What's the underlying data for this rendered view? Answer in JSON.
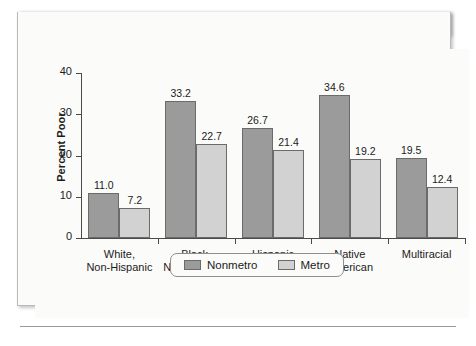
{
  "header": {
    "exhibit_label": "Exhibit 10.7",
    "title": "Poverty by Region and Characteristics"
  },
  "colors": {
    "header_bg": "#262629",
    "header_text": "#ffffff",
    "card_bg": "#fbfbfa",
    "nonmetro": "#9b9b9b",
    "metro": "#d2d2d2",
    "bar_border": "#6b6b6b",
    "axis": "#4a4a4a",
    "text": "#1b1b1b"
  },
  "legend": {
    "position": "bottom-center",
    "items": [
      {
        "label": "Nonmetro",
        "color": "#9b9b9b"
      },
      {
        "label": "Metro",
        "color": "#d2d2d2"
      }
    ]
  },
  "chart_data": {
    "type": "bar",
    "title": "Poverty by Region and Characteristics",
    "xlabel": "",
    "ylabel": "Percent Poor",
    "ylim": [
      0,
      40
    ],
    "yticks": [
      0,
      10,
      20,
      30,
      40
    ],
    "ytick_labels": [
      "0",
      "10",
      "20",
      "30",
      "40"
    ],
    "grid": false,
    "categories": [
      "White,\nNon-Hispanic",
      "Black,\nNon-Hispanic",
      "Hispanic",
      "Native\nAmerican",
      "Multiracial"
    ],
    "series": [
      {
        "name": "Nonmetro",
        "color": "#9b9b9b",
        "values": [
          11.0,
          33.2,
          26.7,
          34.6,
          19.5
        ],
        "labels": [
          "11.0",
          "33.2",
          "26.7",
          "34.6",
          "19.5"
        ]
      },
      {
        "name": "Metro",
        "color": "#d2d2d2",
        "values": [
          7.2,
          22.7,
          21.4,
          19.2,
          12.4
        ],
        "labels": [
          "7.2",
          "22.7",
          "21.4",
          "19.2",
          "12.4"
        ]
      }
    ]
  }
}
